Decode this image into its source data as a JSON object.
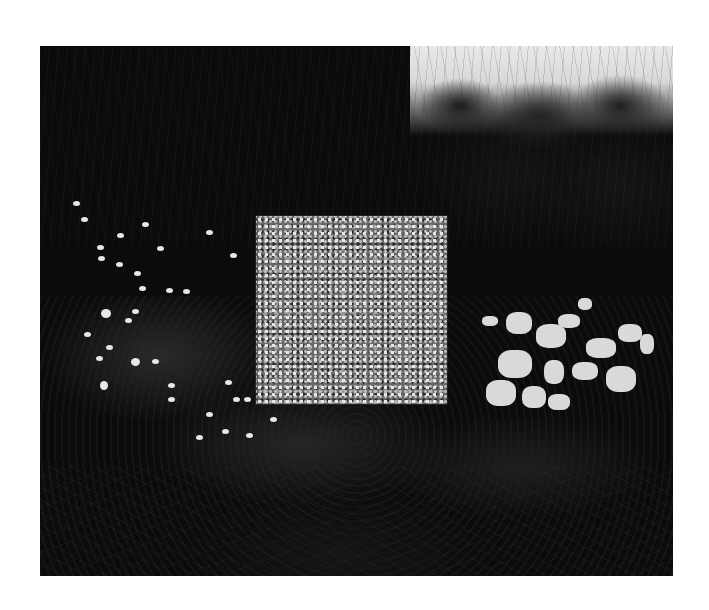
{
  "image": {
    "description": "Black and white photograph of a patterned square panel standing among dark shrubs and trees, with white azalea blossoms to the right and scattered white petals on the left",
    "background": "#ffffff",
    "photo_frame": {
      "left": 40,
      "top": 46,
      "width": 633,
      "height": 530
    },
    "elements": {
      "panel": "patterned-square-panel",
      "right_flowers": "white-azalea-bush",
      "left_flowers": "scattered-white-petals",
      "sky": "overcast-sky-upper-right",
      "trees": "dark-tree-canopy"
    }
  }
}
